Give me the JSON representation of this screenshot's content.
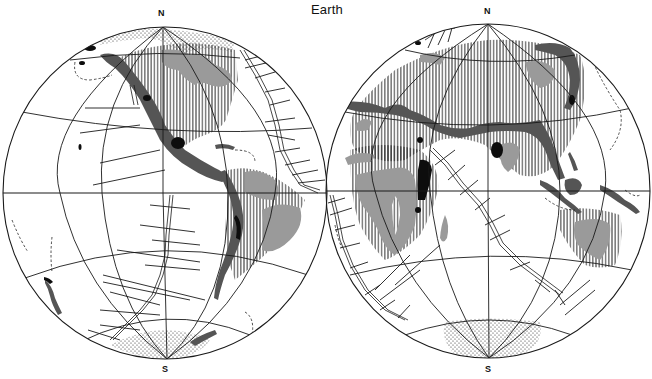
{
  "figure": {
    "title": "Earth",
    "hemispheres": [
      {
        "id": "western",
        "north_label": "N",
        "south_label": "S",
        "center": [
          165,
          193
        ],
        "radius": [
          162,
          166
        ]
      },
      {
        "id": "eastern",
        "north_label": "N",
        "south_label": "S",
        "center": [
          488,
          191
        ],
        "radius": [
          162,
          167
        ]
      }
    ],
    "legend_symbols": {
      "vertical_hatch": "hatched region",
      "light_gray_fill": "light gray region",
      "dark_gray_fill": "dark gray belt",
      "black_fill": "black patches",
      "stipple": "stippled polar region",
      "double_line_with_ticks": "ridge with transverse offsets",
      "dashed_line": "dashed boundary"
    },
    "colors": {
      "background": "#ffffff",
      "line": "#1a1a1a",
      "light_gray": "#9a9a9a",
      "dark_gray": "#555555",
      "black": "#0d0d0d"
    }
  }
}
